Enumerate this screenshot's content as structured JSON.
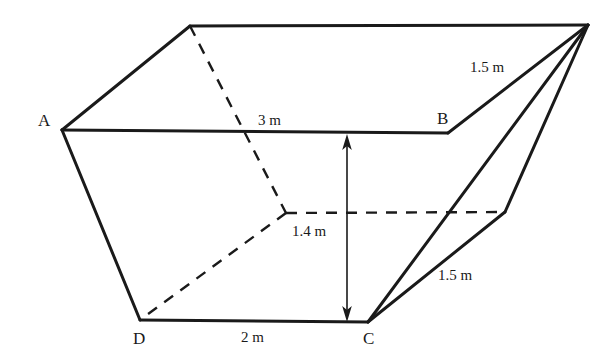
{
  "figure": {
    "background_color": "#ffffff",
    "line_color": "#1a1a1a",
    "text_color": "#1a1a1a",
    "solid_stroke_width": 3,
    "dashed_stroke_width": 2.4,
    "dash_pattern": "11 9",
    "arrow_stroke_width": 1.6
  },
  "vertices": {
    "A": {
      "label": "A",
      "x": 62,
      "y": 130,
      "label_x": 38,
      "label_y": 112
    },
    "B": {
      "label": "B",
      "x": 448,
      "y": 133,
      "label_x": 437,
      "label_y": 110
    },
    "C": {
      "label": "C",
      "x": 368,
      "y": 322,
      "label_x": 363,
      "label_y": 330
    },
    "D": {
      "label": "D",
      "x": 140,
      "y": 320,
      "label_x": 133,
      "label_y": 330
    },
    "top_left": {
      "label": "",
      "x": 190,
      "y": 26
    },
    "top_right": {
      "label": "",
      "x": 588,
      "y": 25
    },
    "back_hidden": {
      "label": "",
      "x": 286,
      "y": 213
    },
    "back_right": {
      "label": "",
      "x": 505,
      "y": 212
    }
  },
  "edges": {
    "solid": [
      {
        "name": "edge-A-B",
        "from": "A",
        "to": "B"
      },
      {
        "name": "edge-A-topleft",
        "from": "A",
        "to": "top_left"
      },
      {
        "name": "edge-topleft-topright",
        "from": "top_left",
        "to": "top_right"
      },
      {
        "name": "edge-B-topright",
        "from": "B",
        "to": "top_right"
      },
      {
        "name": "edge-A-D",
        "from": "A",
        "to": "D"
      },
      {
        "name": "edge-D-C",
        "from": "D",
        "to": "C"
      },
      {
        "name": "edge-C-topright",
        "from": "C",
        "to": "top_right"
      },
      {
        "name": "edge-C-backright",
        "from": "C",
        "to": "back_right"
      },
      {
        "name": "edge-backright-topright",
        "from": "back_right",
        "to": "top_right"
      }
    ],
    "dashed": [
      {
        "name": "hidden-edge-topleft-back",
        "from": "top_left",
        "to": "back_hidden"
      },
      {
        "name": "hidden-edge-back-D",
        "from": "back_hidden",
        "to": "D"
      },
      {
        "name": "hidden-edge-back-backright",
        "from": "back_hidden",
        "to": "back_right"
      }
    ]
  },
  "dimension_arrow": {
    "name": "height-dimension-arrow",
    "x": 347,
    "y_top": 136,
    "y_bottom": 320,
    "double_headed": true
  },
  "measurements": [
    {
      "name": "measure-3m-top",
      "text": "3 m",
      "x": 258,
      "y": 113
    },
    {
      "name": "measure-2m-bottom",
      "text": "2 m",
      "x": 241,
      "y": 330
    },
    {
      "name": "measure-1p4m-height",
      "text": "1.4 m",
      "x": 292,
      "y": 224
    },
    {
      "name": "measure-1p5m-upper-right",
      "text": "1.5 m",
      "x": 470,
      "y": 60
    },
    {
      "name": "measure-1p5m-lower-right",
      "text": "1.5 m",
      "x": 438,
      "y": 268
    }
  ]
}
